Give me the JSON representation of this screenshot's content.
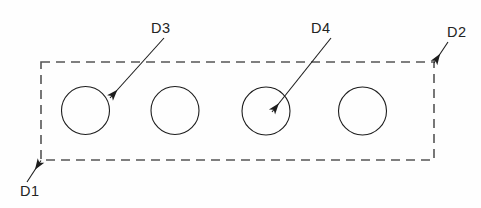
{
  "drawing": {
    "title": "Perforated plate outline with four holes",
    "background_color": "#fefefe",
    "canvas": {
      "width": 481,
      "height": 208
    },
    "style": {
      "outline_color": "#555555",
      "outline_width": 1.6,
      "outline_dash": "9 6",
      "circle_color": "#1d1d1d",
      "circle_width": 1.1,
      "leader_color": "#1d1d1d",
      "leader_width": 1.1,
      "label_color": "#232323",
      "label_font_size": 14.5
    },
    "outline": {
      "name": "plate-outline",
      "shape": "rectangle",
      "line_type": "dashed",
      "x": 41,
      "y": 62,
      "width": 393,
      "height": 98
    },
    "holes": [
      {
        "id": "hole-1",
        "cx": 85.5,
        "cy": 110.5,
        "r": 24
      },
      {
        "id": "hole-2",
        "cx": 175,
        "cy": 110.5,
        "r": 24
      },
      {
        "id": "hole-3",
        "cx": 266,
        "cy": 111,
        "r": 24
      },
      {
        "id": "hole-4",
        "cx": 362.5,
        "cy": 111,
        "r": 24
      }
    ],
    "callouts": [
      {
        "id": "callout-d1",
        "label": "D1",
        "target": "bottom-left-corner",
        "label_x": 20,
        "label_y": 196,
        "leader_start_x": 27,
        "leader_start_y": 182,
        "leader_end_x": 41,
        "leader_end_y": 160.5,
        "arrow_at": "end"
      },
      {
        "id": "callout-d2",
        "label": "D2",
        "target": "top-right-corner",
        "label_x": 447,
        "label_y": 37,
        "leader_start_x": 448,
        "leader_start_y": 42,
        "leader_end_x": 434,
        "leader_end_y": 63,
        "arrow_at": "end"
      },
      {
        "id": "callout-d3",
        "label": "D3",
        "target": "hole-1",
        "label_x": 151,
        "label_y": 33,
        "leader_start_x": 164,
        "leader_start_y": 38,
        "leader_end_x": 110,
        "leader_end_y": 98,
        "arrow_at": "end"
      },
      {
        "id": "callout-d4",
        "label": "D4",
        "target": "hole-3",
        "label_x": 311,
        "label_y": 33,
        "leader_start_x": 331,
        "leader_start_y": 38,
        "leader_end_x": 272,
        "leader_end_y": 112,
        "arrow_at": "end"
      }
    ]
  }
}
